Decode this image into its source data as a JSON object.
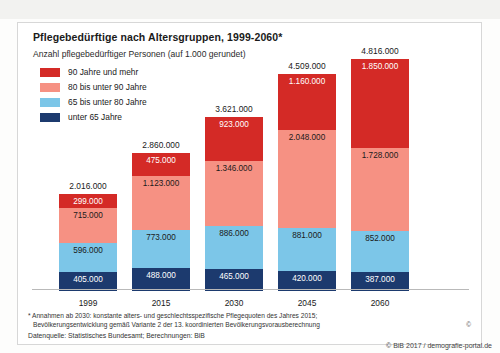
{
  "title": "Pflegebedürftige nach Altersgruppen, 1999-2060*",
  "subtitle": "Anzahl pflegebedürftiger Personen (auf 1.000 gerundet)",
  "legend": [
    {
      "label": "90 Jahre und mehr",
      "color": "#d42a26"
    },
    {
      "label": "80 bis unter 90 Jahre",
      "color": "#f69183"
    },
    {
      "label": "65 bis unter 80 Jahre",
      "color": "#7cc6e8"
    },
    {
      "label": "unter 65 Jahre",
      "color": "#1c3a6e"
    }
  ],
  "footnote_line1": "* Annahmen ab 2030: konstante alters- und geschlechtsspezifische Pflegequoten des Jahres 2015;",
  "footnote_line2": "Bevölkerungsentwicklung gemäß Variante 2 der 13. koordinierten Bevölkerungsvorausberechnung",
  "source": "Datenquelle: Statistisches Bundesamt; Berechnungen: BiB",
  "copyright_mark": "©",
  "credit": "© BiB 2017 / demografie-portal.de",
  "chart_data": {
    "type": "bar",
    "stacked": true,
    "title": "Pflegebedürftige nach Altersgruppen, 1999-2060*",
    "subtitle": "Anzahl pflegebedürftiger Personen (auf 1.000 gerundet)",
    "xlabel": "",
    "ylabel": "Anzahl pflegebedürftiger Personen",
    "ylim": [
      0,
      4816000
    ],
    "grid": false,
    "legend_position": "top-left",
    "categories": [
      "1999",
      "2015",
      "2030",
      "2045",
      "2060"
    ],
    "series": [
      {
        "name": "unter 65 Jahre",
        "color": "#1c3a6e",
        "values": [
          405000,
          488000,
          465000,
          420000,
          387000
        ],
        "value_labels": [
          "405.000",
          "488.000",
          "465.000",
          "420.000",
          "387.000"
        ]
      },
      {
        "name": "65 bis unter 80 Jahre",
        "color": "#7cc6e8",
        "values": [
          596000,
          773000,
          886000,
          881000,
          852000
        ],
        "value_labels": [
          "596.000",
          "773.000",
          "886.000",
          "881.000",
          "852.000"
        ]
      },
      {
        "name": "80 bis unter 90 Jahre",
        "color": "#f69183",
        "values": [
          715000,
          1123000,
          1346000,
          2048000,
          1728000
        ],
        "value_labels": [
          "715.000",
          "1.123.000",
          "1.346.000",
          "2.048.000",
          "1.728.000"
        ]
      },
      {
        "name": "90 Jahre und mehr",
        "color": "#d42a26",
        "values": [
          299000,
          475000,
          923000,
          1160000,
          1850000
        ],
        "value_labels": [
          "299.000",
          "475.000",
          "923.000",
          "1.160.000",
          "1.850.000"
        ]
      }
    ],
    "totals": [
      2016000,
      2860000,
      3621000,
      4509000,
      4816000
    ],
    "total_labels": [
      "2.016.000",
      "2.860.000",
      "3.621.000",
      "4.509.000",
      "4.816.000"
    ]
  }
}
